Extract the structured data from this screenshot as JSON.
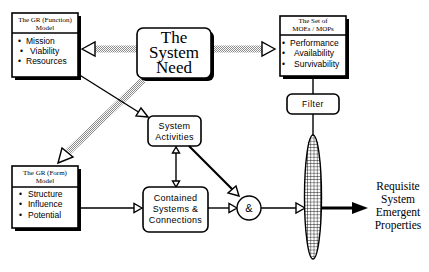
{
  "diagram": {
    "function_model": {
      "title_line1": "The GR (Function)",
      "title_line2": "Model",
      "items": [
        "Mission",
        "Viability",
        "Resources"
      ]
    },
    "system_need": {
      "line1": "The",
      "line2": "System",
      "line3": "Need"
    },
    "moe_set": {
      "title_line1": "The Set of",
      "title_line2": "MOEs / MOPs",
      "items": [
        "Performance",
        "Availability",
        "Survivability"
      ]
    },
    "filter": {
      "label": "Filter"
    },
    "system_activities": {
      "line1": "System",
      "line2": "Activities"
    },
    "form_model": {
      "title_line1": "The GR (Form)",
      "title_line2": "Model",
      "items": [
        "Structure",
        "Influence",
        "Potential"
      ]
    },
    "contained_systems": {
      "line1": "Contained",
      "line2": "Systems  &",
      "line3": "Connections"
    },
    "and_node": {
      "label": "&"
    },
    "output": {
      "line1": "Requisite",
      "line2": "System",
      "line3": "Emergent",
      "line4": "Properties"
    },
    "bullet_glyph": "•"
  }
}
